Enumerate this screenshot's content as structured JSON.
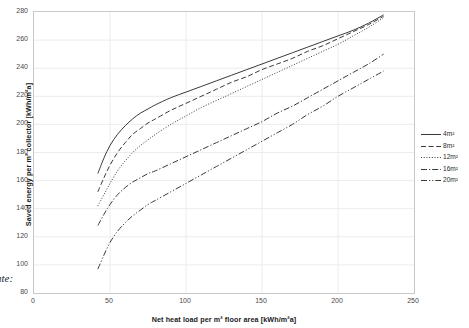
{
  "chart_data": {
    "type": "line",
    "title": "",
    "xlabel": "Net heat load per m² floor area [kWh/m²a]",
    "ylabel": "Saved energy per m² collector [kWh/m²a]",
    "xlim": [
      0,
      250
    ],
    "ylim": [
      80,
      280
    ],
    "xticks": [
      "0",
      "50",
      "100",
      "150",
      "200",
      "250"
    ],
    "yticks": [
      "80",
      "100",
      "120",
      "140",
      "160",
      "180",
      "200",
      "220",
      "240",
      "260",
      "280"
    ],
    "grid": true,
    "legend_position": "right",
    "series": [
      {
        "name": "4m²",
        "style": "solid",
        "x": [
          42,
          46,
          50,
          55,
          60,
          65,
          70,
          75,
          80,
          90,
          100,
          110,
          120,
          130,
          140,
          150,
          160,
          170,
          180,
          190,
          200,
          210,
          220,
          230
        ],
        "y": [
          165,
          176,
          185,
          193,
          199,
          204,
          208,
          211,
          214,
          219,
          223,
          227,
          231,
          235,
          239,
          243,
          247,
          251,
          255,
          259,
          263,
          267,
          272,
          278
        ]
      },
      {
        "name": "8m²",
        "style": "dashed",
        "x": [
          42,
          46,
          50,
          55,
          60,
          65,
          70,
          75,
          80,
          90,
          100,
          110,
          120,
          130,
          140,
          150,
          160,
          170,
          180,
          190,
          200,
          210,
          220,
          230
        ],
        "y": [
          152,
          162,
          171,
          180,
          187,
          193,
          197,
          201,
          204,
          210,
          215,
          220,
          225,
          230,
          234,
          239,
          243,
          247,
          252,
          256,
          261,
          266,
          271,
          277
        ]
      },
      {
        "name": "12m²",
        "style": "dotted",
        "x": [
          42,
          46,
          50,
          55,
          60,
          65,
          70,
          75,
          80,
          90,
          100,
          110,
          120,
          130,
          140,
          150,
          160,
          170,
          180,
          190,
          200,
          210,
          220,
          230
        ],
        "y": [
          142,
          150,
          158,
          167,
          174,
          180,
          185,
          189,
          193,
          200,
          206,
          212,
          217,
          222,
          227,
          232,
          237,
          242,
          247,
          252,
          257,
          263,
          269,
          276
        ]
      },
      {
        "name": "16m²",
        "style": "dash-dot",
        "x": [
          42,
          46,
          50,
          55,
          60,
          65,
          70,
          75,
          80,
          90,
          100,
          110,
          120,
          130,
          140,
          150,
          160,
          170,
          180,
          190,
          200,
          210,
          220,
          230
        ],
        "y": [
          128,
          136,
          143,
          150,
          155,
          159,
          162,
          165,
          167,
          172,
          177,
          182,
          187,
          192,
          197,
          202,
          208,
          213,
          219,
          225,
          231,
          237,
          243,
          250
        ]
      },
      {
        "name": "20m²",
        "style": "dash-dot-dot",
        "x": [
          42,
          46,
          50,
          55,
          60,
          65,
          70,
          75,
          80,
          90,
          100,
          110,
          120,
          130,
          140,
          150,
          160,
          170,
          180,
          190,
          200,
          210,
          220,
          230
        ],
        "y": [
          97,
          107,
          116,
          124,
          130,
          135,
          139,
          143,
          146,
          152,
          158,
          164,
          170,
          176,
          182,
          188,
          194,
          200,
          207,
          213,
          220,
          226,
          232,
          238
        ]
      }
    ]
  },
  "legend": {
    "items": [
      {
        "label": "4m²"
      },
      {
        "label": "8m²"
      },
      {
        "label": "12m²"
      },
      {
        "label": "16m²"
      },
      {
        "label": "20m²"
      }
    ]
  },
  "annotations": {
    "stray_caption": "ate:"
  },
  "colors": {
    "line": "#3a3a3a",
    "grid": "#ececec",
    "frame": "#c9c9c9",
    "tick_text": "#4a4a4a",
    "axis_title": "#1a1a1a"
  }
}
